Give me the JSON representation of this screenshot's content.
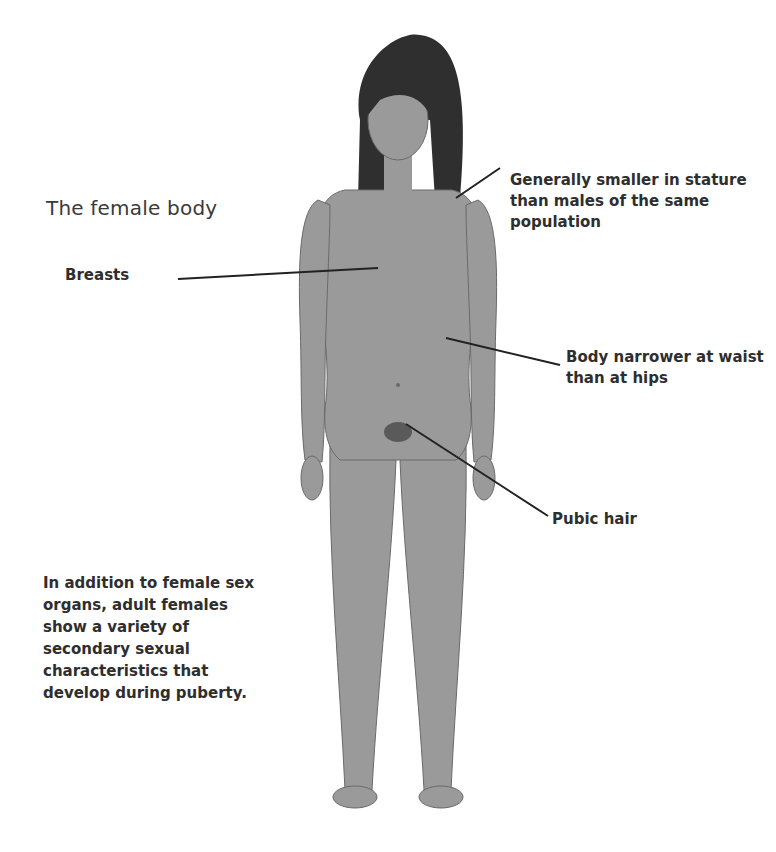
{
  "title": "The female body",
  "labels": {
    "stature": "Generally smaller in stature than males of the same population",
    "breasts": "Breasts",
    "waist": "Body narrower at waist than at hips",
    "pubic": "Pubic hair"
  },
  "note": "In addition to female sex organs, adult females show a variety of secondary sexual characteristics that develop during puberty.",
  "colors": {
    "body": "#9a9a9a",
    "body_shadow": "#808080",
    "hair": "#2f2f2f",
    "text": "#2e2e2e",
    "leader_line": "#222222"
  }
}
